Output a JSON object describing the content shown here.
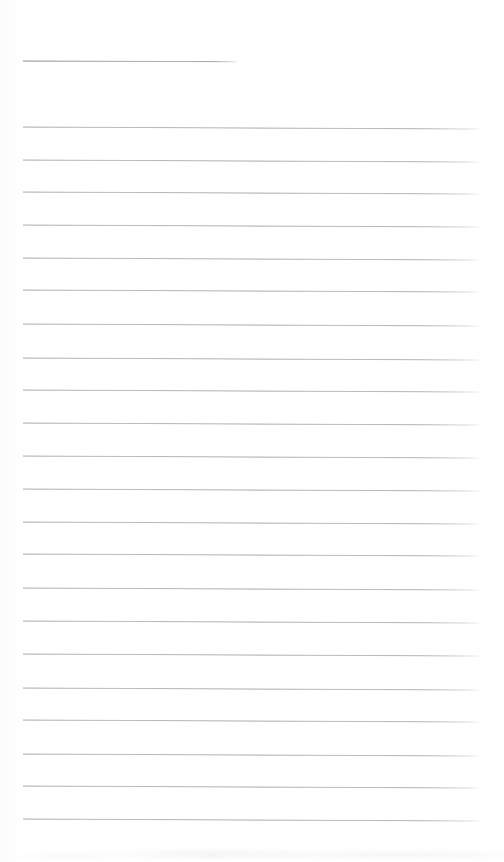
{
  "document": {
    "type": "ruled-writing-paper",
    "title": "",
    "page_width": 504,
    "page_height": 862,
    "background_color": "#ffffff",
    "rule_color": "#b9babd",
    "header_rule_color": "#a9aaad",
    "body_text": "",
    "visible_text": []
  },
  "layout": {
    "rule_left_x": 23,
    "rule_right_x": 480,
    "rule_full_width": 457,
    "rule_spacing": 32.7,
    "rule_thickness": 1,
    "slope_px": 2
  },
  "header_rule": {
    "name": "header-rule",
    "x": 23,
    "y": 60,
    "width": 214,
    "label": ""
  },
  "rules": [
    {
      "index": 1,
      "y": 126,
      "x": 23,
      "width": 457
    },
    {
      "index": 2,
      "y": 158.5,
      "x": 23,
      "width": 457
    },
    {
      "index": 3,
      "y": 191,
      "x": 23,
      "width": 457
    },
    {
      "index": 4,
      "y": 223.7,
      "x": 23,
      "width": 457
    },
    {
      "index": 5,
      "y": 256.5,
      "x": 23,
      "width": 457
    },
    {
      "index": 6,
      "y": 289.3,
      "x": 23,
      "width": 457
    },
    {
      "index": 7,
      "y": 323,
      "x": 23,
      "width": 457
    },
    {
      "index": 8,
      "y": 356.5,
      "x": 23,
      "width": 457
    },
    {
      "index": 9,
      "y": 389.3,
      "x": 23,
      "width": 457
    },
    {
      "index": 10,
      "y": 422.3,
      "x": 23,
      "width": 457
    },
    {
      "index": 11,
      "y": 455.3,
      "x": 23,
      "width": 457
    },
    {
      "index": 12,
      "y": 488,
      "x": 23,
      "width": 457
    },
    {
      "index": 13,
      "y": 520.7,
      "x": 23,
      "width": 457
    },
    {
      "index": 14,
      "y": 553.3,
      "x": 23,
      "width": 457
    },
    {
      "index": 15,
      "y": 587.3,
      "x": 23,
      "width": 457
    },
    {
      "index": 16,
      "y": 620,
      "x": 23,
      "width": 457
    },
    {
      "index": 17,
      "y": 653.3,
      "x": 23,
      "width": 457
    },
    {
      "index": 18,
      "y": 686.7,
      "x": 23,
      "width": 457
    },
    {
      "index": 19,
      "y": 719.3,
      "x": 23,
      "width": 457
    },
    {
      "index": 20,
      "y": 752.7,
      "x": 23,
      "width": 457
    },
    {
      "index": 21,
      "y": 785,
      "x": 23,
      "width": 457
    },
    {
      "index": 22,
      "y": 818.3,
      "x": 23,
      "width": 457
    }
  ]
}
